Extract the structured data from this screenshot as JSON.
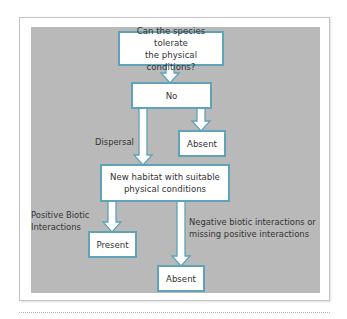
{
  "diagram": {
    "type": "flowchart",
    "colors": {
      "panel_background": "#b9b9b9",
      "box_border": "#5fa3b8",
      "box_fill": "#ffffff"
    },
    "nodes": {
      "question": "Can the species tolerate the physical conditions?",
      "question_line1": "Can the species tolerate",
      "question_line2": "the physical conditions?",
      "no": "No",
      "absent_1": "Absent",
      "new_habitat_line1": "New habitat with suitable",
      "new_habitat_line2": "physical conditions",
      "present": "Present",
      "absent_2": "Absent"
    },
    "edge_labels": {
      "dispersal": "Dispersal",
      "positive_line1": "Positive Biotic",
      "positive_line2": "Interactions",
      "negative_line1": "Negative biotic interactions or",
      "negative_line2": "missing positive interactions"
    },
    "edges": [
      {
        "from": "question",
        "to": "no"
      },
      {
        "from": "no",
        "to": "absent_1"
      },
      {
        "from": "no",
        "to": "new_habitat",
        "label": "Dispersal"
      },
      {
        "from": "new_habitat",
        "to": "present",
        "label": "Positive Biotic Interactions"
      },
      {
        "from": "new_habitat",
        "to": "absent_2",
        "label": "Negative biotic interactions or missing positive interactions"
      }
    ]
  }
}
